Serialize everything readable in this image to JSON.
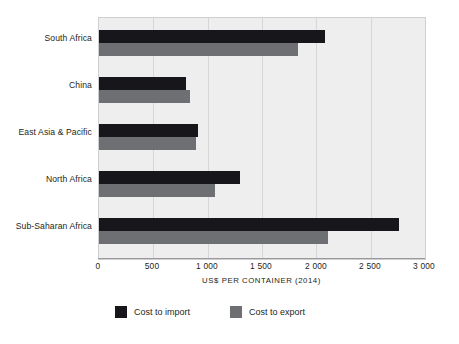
{
  "chart_data": {
    "type": "bar",
    "orientation": "horizontal",
    "title": "",
    "subtitle": "",
    "xlabel": "US$ PER CONTAINER (2014)",
    "ylabel": "",
    "xlim": [
      0,
      3000
    ],
    "xticks": [
      0,
      500,
      1000,
      1500,
      2000,
      2500,
      3000
    ],
    "xtick_labels": [
      "0",
      "500",
      "1 000",
      "1 500",
      "2 000",
      "2 500",
      "3 000"
    ],
    "grid": true,
    "grid_axis": "x",
    "legend_position": "bottom",
    "categories": [
      "South Africa",
      "China",
      "East Asia & Pacific",
      "North Africa",
      "Sub-Saharan Africa"
    ],
    "series": [
      {
        "name": "Cost to import",
        "color": "#17161a",
        "values": [
          2080,
          800,
          915,
          1300,
          2760
        ]
      },
      {
        "name": "Cost to export",
        "color": "#6e6f72",
        "values": [
          1830,
          840,
          890,
          1070,
          2110
        ]
      }
    ]
  },
  "axis": {
    "x_title": "US$ PER CONTAINER (2014)",
    "tick_labels": [
      "0",
      "500",
      "1 000",
      "1 500",
      "2 000",
      "2 500",
      "3 000"
    ]
  },
  "categories": [
    {
      "label": "South Africa"
    },
    {
      "label": "China"
    },
    {
      "label": "East Asia & Pacific"
    },
    {
      "label": "North Africa"
    },
    {
      "label": "Sub-Saharan Africa"
    }
  ],
  "legend": {
    "items": [
      {
        "label": "Cost to import",
        "color": "#17161a"
      },
      {
        "label": "Cost to export",
        "color": "#6e6f72"
      }
    ]
  },
  "colors": {
    "import": "#17161a",
    "export": "#6e6f72",
    "plot_background": "#eeeeef",
    "gridline": "#d6d6d8",
    "text": "#231f20"
  }
}
